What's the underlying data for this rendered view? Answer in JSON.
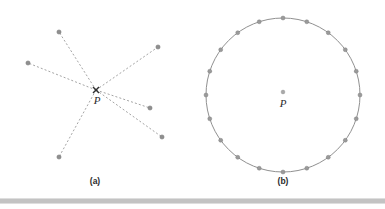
{
  "figure": {
    "width": 385,
    "height": 209,
    "background_color": "#ffffff",
    "type": "geometry-diagram",
    "panels": [
      {
        "id": "panel-a",
        "caption": "(a)",
        "caption_x": 95,
        "caption_y": 182,
        "description": "Six dashed rays converging at a single point P",
        "center_label": "P",
        "center_label_x": 97,
        "center_label_y": 101,
        "converge_point": {
          "x": 96,
          "y": 90
        },
        "converge_marker": "x-marker",
        "converge_marker_color": "#303030",
        "ray_color": "#9a9a9a",
        "endpoint_color": "#8f8f8f",
        "endpoint_radius": 2.1,
        "rays": [
          {
            "name": "ray-up-left",
            "x": 59,
            "y": 32
          },
          {
            "name": "ray-up-right",
            "x": 158,
            "y": 47
          },
          {
            "name": "ray-left",
            "x": 28,
            "y": 63
          },
          {
            "name": "ray-down-right",
            "x": 162,
            "y": 137
          },
          {
            "name": "ray-down-left",
            "x": 59,
            "y": 157
          },
          {
            "name": "ray-right-low",
            "x": 150,
            "y": 108
          }
        ]
      },
      {
        "id": "panel-b",
        "caption": "(b)",
        "caption_x": 283,
        "caption_y": 182,
        "description": "A circle of points equidistant from center P",
        "center_label": "P",
        "center_label_x": 283,
        "center_label_y": 104,
        "center_dot": {
          "x": 283,
          "y": 92
        },
        "center_dot_radius": 1.9,
        "circle_center": {
          "x": 283,
          "y": 95
        },
        "circle_radius": 77,
        "circle_stroke_color": "#8a8a8a",
        "marker_count": 20,
        "marker_color": "#9a9a9a",
        "marker_radius": 2.0,
        "marker_start_angle_deg": -90
      }
    ],
    "divider": {
      "name": "bottom-divider",
      "x": 0,
      "y": 199,
      "width": 385,
      "height": 4,
      "color": "#c3c3c3"
    }
  }
}
